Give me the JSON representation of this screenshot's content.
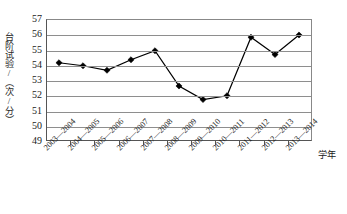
{
  "chart_data": {
    "type": "line",
    "title": "",
    "xlabel": "学年",
    "ylabel": "台阶试验/（次/分）",
    "ylim": [
      49,
      57
    ],
    "ytick_step": 1,
    "yticks": [
      57,
      56,
      55,
      54,
      53,
      52,
      51,
      50,
      49
    ],
    "grid": true,
    "legend": "none",
    "marker": "diamond",
    "marker_color": "#000000",
    "line_color": "#000000",
    "categories": [
      "2003—2004",
      "2004—2005",
      "2005—2006",
      "2006—2007",
      "2007—2008",
      "2008—2009",
      "2009—2010",
      "2010—2011",
      "2011—2012",
      "2012—2013",
      "2013—2014"
    ],
    "values": [
      54.15,
      53.95,
      53.65,
      54.35,
      54.95,
      52.6,
      51.7,
      51.95,
      55.85,
      54.7,
      56.0
    ],
    "series": [
      {
        "name": "台阶试验",
        "values": [
          54.15,
          53.95,
          53.65,
          54.35,
          54.95,
          52.6,
          51.7,
          51.95,
          55.85,
          54.7,
          56.0
        ]
      }
    ]
  }
}
